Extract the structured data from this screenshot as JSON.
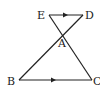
{
  "diagram": {
    "type": "geometry",
    "colors": {
      "stroke": "#222222",
      "background": "#ffffff"
    },
    "points": {
      "E": {
        "label": "E",
        "x": 49,
        "y": 15,
        "label_x": 37,
        "label_y": 19
      },
      "D": {
        "label": "D",
        "x": 83,
        "y": 15,
        "label_x": 85,
        "label_y": 19
      },
      "A": {
        "label": "A",
        "x": 63,
        "y": 33,
        "label_x": 58,
        "label_y": 47
      },
      "B": {
        "label": "B",
        "x": 19,
        "y": 80,
        "label_x": 7,
        "label_y": 85
      },
      "C": {
        "label": "C",
        "x": 92,
        "y": 80,
        "label_x": 93,
        "label_y": 85
      }
    },
    "segments": [
      {
        "from": "E",
        "to": "D",
        "parallel_mark": true
      },
      {
        "from": "B",
        "to": "C",
        "parallel_mark": true
      },
      {
        "from": "E",
        "to": "C",
        "parallel_mark": false
      },
      {
        "from": "D",
        "to": "B",
        "parallel_mark": false
      }
    ]
  }
}
